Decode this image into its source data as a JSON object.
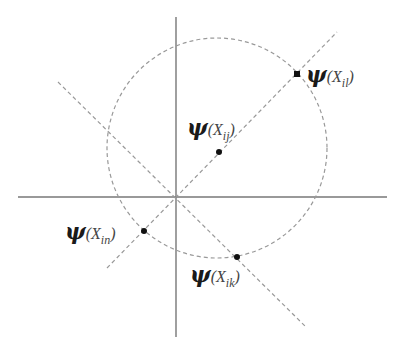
{
  "diagram": {
    "type": "vector-projection-circle",
    "colors": {
      "axis": "#777777",
      "dashed": "#999999",
      "point": "#111111",
      "text": "#1a1a1a"
    },
    "axes": {
      "horizontal": {
        "x1": 18,
        "y1": 197,
        "x2": 387,
        "y2": 197
      },
      "vertical": {
        "x1": 176,
        "y1": 17,
        "x2": 176,
        "y2": 337
      }
    },
    "circle": {
      "cx": 217,
      "cy": 148,
      "r": 110
    },
    "lines": [
      {
        "name": "positive-diagonal",
        "x1": 107,
        "y1": 268,
        "x2": 337,
        "y2": 32
      },
      {
        "name": "negative-diagonal",
        "x1": 58,
        "y1": 82,
        "x2": 306,
        "y2": 327
      }
    ],
    "points": [
      {
        "name": "x-il",
        "x": 297,
        "y": 74,
        "shape": "square"
      },
      {
        "name": "x-ij",
        "x": 219,
        "y": 152,
        "shape": "dot"
      },
      {
        "name": "x-in",
        "x": 144,
        "y": 231,
        "shape": "dot"
      },
      {
        "name": "x-ik",
        "x": 237,
        "y": 257,
        "shape": "dot"
      }
    ],
    "labels": {
      "il": {
        "psi": "ψ",
        "open": "(",
        "x": "X",
        "sub": "il",
        "close": ")"
      },
      "ij": {
        "psi": "ψ",
        "open": "(",
        "x": "X",
        "sub": "ij",
        "close": ")"
      },
      "in": {
        "psi": "ψ",
        "open": "(",
        "x": "X",
        "sub": "in",
        "close": ")"
      },
      "ik": {
        "psi": "ψ",
        "open": "(",
        "x": "X",
        "sub": "ik",
        "close": ")"
      }
    }
  }
}
